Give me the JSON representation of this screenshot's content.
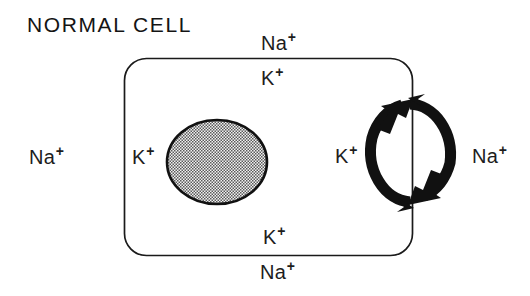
{
  "figure": {
    "title": "NORMAL CELL",
    "background_color": "#ffffff",
    "ink_color": "#1a1a1a"
  },
  "cell": {
    "name": "cell-membrane-outline",
    "shape": "rounded-rectangle",
    "stroke_color": "#1a1a1a"
  },
  "nucleus": {
    "name": "nucleus",
    "shape": "ellipse",
    "fill": "stippled-gray",
    "fill_color": "#a8a8a8",
    "stroke_color": "#111111"
  },
  "pump": {
    "name": "sodium-potassium-pump",
    "inward_arrow_ion": "K",
    "outward_arrow_ion": "Na",
    "arrow_color": "#111111"
  },
  "labels": {
    "na_top": {
      "ion": "Na",
      "charge": "+",
      "location": "extracellular-top"
    },
    "k_top": {
      "ion": "K",
      "charge": "+",
      "location": "intracellular-top"
    },
    "na_left": {
      "ion": "Na",
      "charge": "+",
      "location": "extracellular-left"
    },
    "k_left": {
      "ion": "K",
      "charge": "+",
      "location": "intracellular-left"
    },
    "k_pump": {
      "ion": "K",
      "charge": "+",
      "location": "pump-inward"
    },
    "na_right": {
      "ion": "Na",
      "charge": "+",
      "location": "pump-outward"
    },
    "k_bottom": {
      "ion": "K",
      "charge": "+",
      "location": "intracellular-bottom"
    },
    "na_bottom": {
      "ion": "Na",
      "charge": "+",
      "location": "extracellular-bottom"
    }
  }
}
